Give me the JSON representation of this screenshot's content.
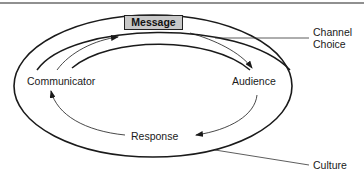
{
  "diagram": {
    "type": "communication-process-model",
    "nodes": {
      "message": "Message",
      "communicator": "Communicator",
      "audience": "Audience",
      "response": "Response"
    },
    "callouts": {
      "channel_line1": "Channel",
      "channel_line2": "Choice",
      "culture": "Culture"
    },
    "flow": [
      {
        "from": "Communicator",
        "to": "Message"
      },
      {
        "from": "Message",
        "to": "Audience"
      },
      {
        "from": "Audience",
        "to": "Response"
      },
      {
        "from": "Response",
        "to": "Communicator"
      }
    ],
    "layers": [
      {
        "name": "Channel Choice",
        "shape": "arc-band"
      },
      {
        "name": "Culture",
        "shape": "ellipse"
      }
    ],
    "colors": {
      "line": "#1a1a1a",
      "message_fill": "#c8c8c8",
      "background": "#ffffff"
    }
  }
}
